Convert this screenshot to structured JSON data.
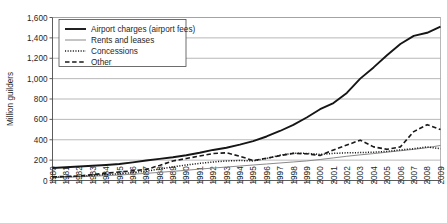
{
  "chart_data": {
    "type": "line",
    "title": "",
    "xlabel": "",
    "ylabel": "Million guilders",
    "ylim": [
      0,
      1600
    ],
    "ytick_step": 200,
    "grid": true,
    "legend_position": "top-left",
    "categories": [
      "1980",
      "1981",
      "1982",
      "1983",
      "1984",
      "1985",
      "1986",
      "1987",
      "1988",
      "1989",
      "1990",
      "1991",
      "1992",
      "1993",
      "1994",
      "1995",
      "1996",
      "1997",
      "1998",
      "1999",
      "2000",
      "2001",
      "2002",
      "2003",
      "2004",
      "2005",
      "2006",
      "2007",
      "2008",
      "2009"
    ],
    "yticks": [
      "0",
      "200",
      "400",
      "600",
      "800",
      "1,000",
      "1,200",
      "1,400",
      "1,600"
    ],
    "series": [
      {
        "name": "Airport charges (airport fees)",
        "style": "solid-thick",
        "color": "#161616",
        "values": [
          122,
          130,
          138,
          145,
          152,
          162,
          178,
          196,
          212,
          228,
          248,
          272,
          300,
          322,
          352,
          386,
          432,
          486,
          546,
          618,
          700,
          760,
          860,
          1000,
          1110,
          1230,
          1340,
          1420,
          1450,
          1510
        ]
      },
      {
        "name": "Rents and leases",
        "style": "solid-thin",
        "color": "#8a8a8a",
        "values": [
          28,
          32,
          36,
          42,
          48,
          54,
          62,
          70,
          80,
          90,
          100,
          112,
          122,
          132,
          142,
          152,
          162,
          172,
          182,
          192,
          206,
          222,
          238,
          252,
          264,
          278,
          292,
          306,
          322,
          344
        ]
      },
      {
        "name": "Concessions",
        "style": "dotted",
        "color": "#1a1a1a",
        "values": [
          34,
          38,
          42,
          50,
          58,
          66,
          78,
          92,
          112,
          134,
          152,
          168,
          182,
          192,
          196,
          192,
          216,
          248,
          268,
          266,
          256,
          266,
          272,
          274,
          278,
          286,
          300,
          312,
          330,
          312
        ]
      },
      {
        "name": "Other",
        "style": "dashed",
        "color": "#1a1a1a",
        "values": [
          36,
          40,
          44,
          58,
          72,
          84,
          96,
          108,
          148,
          192,
          216,
          240,
          264,
          272,
          238,
          196,
          218,
          244,
          266,
          262,
          246,
          300,
          348,
          396,
          330,
          306,
          330,
          480,
          548,
          500
        ]
      }
    ]
  }
}
